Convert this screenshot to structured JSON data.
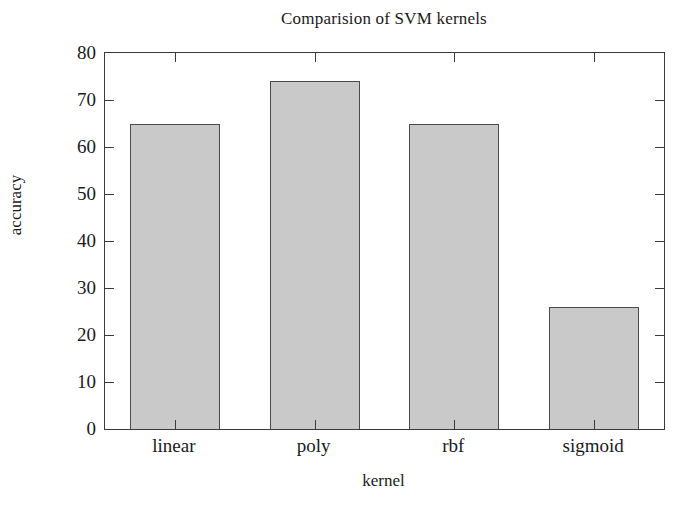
{
  "chart_data": {
    "type": "bar",
    "title": "Comparision of SVM kernels",
    "xlabel": "kernel",
    "ylabel": "accuracy",
    "categories": [
      "linear",
      "poly",
      "rbf",
      "sigmoid"
    ],
    "values": [
      65,
      74,
      64.8,
      26
    ],
    "ylim": [
      0,
      80
    ],
    "yticks": [
      0,
      10,
      20,
      30,
      40,
      50,
      60,
      70,
      80
    ],
    "ytick_labels": [
      "0",
      "10",
      "20",
      "30",
      "40",
      "50",
      "60",
      "70",
      "80"
    ],
    "grid": false,
    "legend": null,
    "bar_fill_color": "#c9c9c9",
    "bar_edge_color": "#4a4a4a",
    "axis_color": "#3a3a3a",
    "background_color": "#ffffff"
  }
}
